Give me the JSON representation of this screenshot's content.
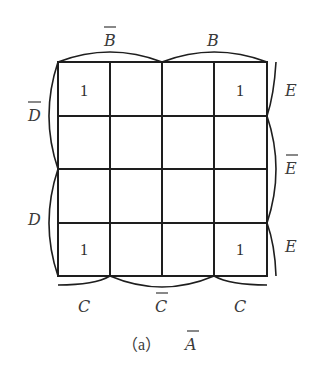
{
  "diagram": {
    "type": "karnaugh-map",
    "caption": {
      "prefix": "（a）",
      "variable": "A",
      "variable_overbar": true
    },
    "top_labels": [
      {
        "text": "B",
        "overbar": true,
        "span_cols": [
          0,
          1
        ]
      },
      {
        "text": "B",
        "overbar": false,
        "span_cols": [
          2,
          3
        ]
      }
    ],
    "bottom_labels": [
      {
        "text": "C",
        "overbar": false,
        "span_cols": [
          0,
          0
        ]
      },
      {
        "text": "C",
        "overbar": true,
        "span_cols": [
          1,
          2
        ]
      },
      {
        "text": "C",
        "overbar": false,
        "span_cols": [
          3,
          3
        ]
      }
    ],
    "left_labels": [
      {
        "text": "D",
        "overbar": true,
        "span_rows": [
          0,
          1
        ]
      },
      {
        "text": "D",
        "overbar": false,
        "span_rows": [
          2,
          3
        ]
      }
    ],
    "right_labels": [
      {
        "text": "E",
        "overbar": false,
        "span_rows": [
          0,
          0
        ]
      },
      {
        "text": "E",
        "overbar": true,
        "span_rows": [
          1,
          2
        ]
      },
      {
        "text": "E",
        "overbar": false,
        "span_rows": [
          3,
          3
        ]
      }
    ],
    "cells": [
      [
        "1",
        "",
        "",
        "1"
      ],
      [
        "",
        "",
        "",
        ""
      ],
      [
        "",
        "",
        "",
        ""
      ],
      [
        "1",
        "",
        "",
        "1"
      ]
    ],
    "line_color": "#1e1e1e",
    "text_color": "#3a3a3a"
  }
}
